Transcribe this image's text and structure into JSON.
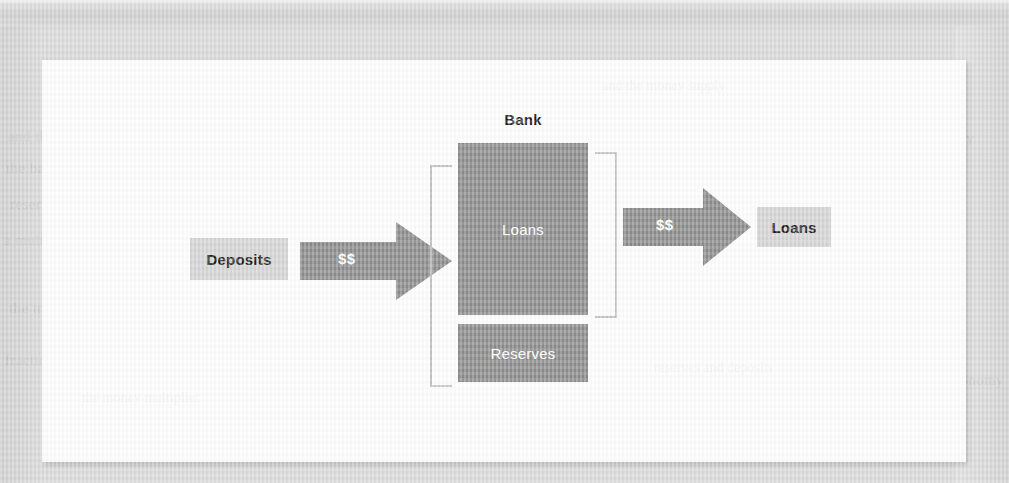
{
  "figure": {
    "title_label": "Bank",
    "source_box": {
      "label": "Deposits"
    },
    "flow_in_arrow": {
      "label": "$$",
      "icon": "right-arrow-icon"
    },
    "balance_sheet": {
      "assets_box": {
        "label": "Loans"
      },
      "reserves_box": {
        "label": "Reserves"
      }
    },
    "left_bracket": {
      "icon": "bracket-left-icon"
    },
    "right_bracket": {
      "icon": "bracket-right-icon"
    },
    "flow_out_arrow": {
      "label": "$$",
      "icon": "right-arrow-icon"
    },
    "destination_box": {
      "label": "Loans"
    }
  },
  "colors": {
    "page_background": "#d9d9d9",
    "panel_background": "#fdfdfd",
    "light_box_fill": "#d4d4d4",
    "dark_box_fill": "#8c8c8c",
    "arrow_fill": "#8c8c8c",
    "bracket_stroke": "#c4c4c4",
    "dark_text": "#1b1b1b",
    "light_text": "#ffffff"
  },
  "background_ghost_text": {
    "lines": [
      "and the money supply",
      "the banking system",
      "reserves and deposits",
      "a multiple expansion of",
      "the money multiplier",
      "fractional reserve banking",
      "and currency held by",
      "the public in the economy"
    ]
  }
}
